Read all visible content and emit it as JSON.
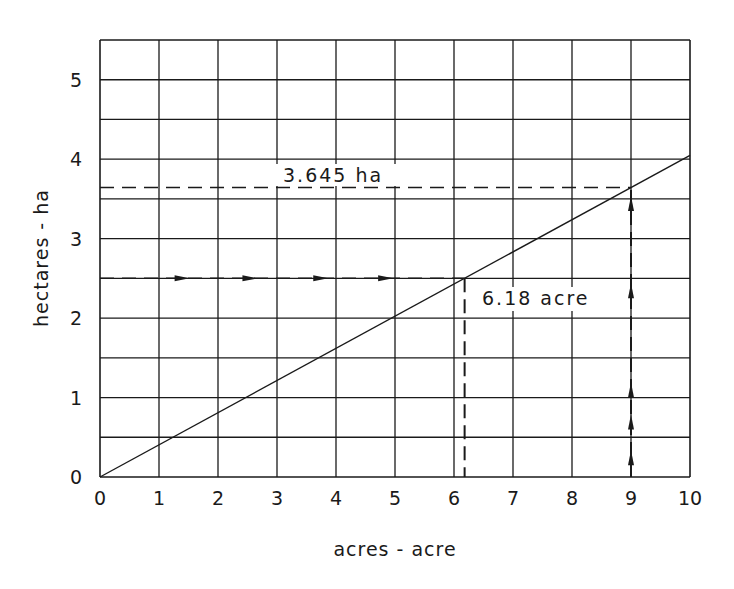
{
  "chart_data": {
    "type": "line",
    "title": "",
    "xlabel": "acres - acre",
    "ylabel": "hectares - ha",
    "xlim": [
      0,
      10
    ],
    "ylim": [
      0,
      5.5
    ],
    "x_ticks": [
      "0",
      "1",
      "2",
      "3",
      "4",
      "5",
      "6",
      "7",
      "8",
      "9",
      "10"
    ],
    "y_ticks": [
      "0",
      "1",
      "2",
      "3",
      "4",
      "5"
    ],
    "grid": true,
    "grid_x_step": 1,
    "grid_y_step": 0.5,
    "series": [
      {
        "name": "acres to hectares",
        "x": [
          0,
          10
        ],
        "values": [
          0,
          4.047
        ]
      }
    ],
    "annotations": [
      {
        "label": "6.18 acre",
        "description": "Horizontal dashed arrow at 2.5 ha to line, then dashed drop to x = 6.18 acre",
        "ha": 2.5,
        "acre": 6.18
      },
      {
        "label": "3.645 ha",
        "description": "Vertical dashed arrow up from 9 acre to line, then dashed line left at y = 3.645 ha",
        "acre": 9,
        "ha": 3.645
      }
    ]
  },
  "labels": {
    "x_axis_title": "acres - acre",
    "y_axis_title": "hectares - ha",
    "annotation_ha": "3.645 ha",
    "annotation_acre": "6.18 acre"
  }
}
